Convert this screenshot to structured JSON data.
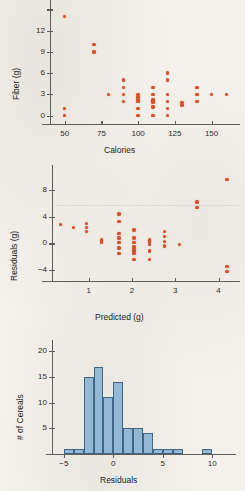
{
  "figure": {
    "background_color": "#f4f1ec",
    "dot_color": "#d9502c",
    "bar_fill_color": "#93b7d4",
    "bar_edge_color": "#3f6687",
    "axis_color": "#5d5d5d"
  },
  "charts": [
    {
      "id": "fiber-vs-calories",
      "type": "scatter",
      "title": "",
      "xlabel": "Calories",
      "ylabel": "Fiber (g)",
      "xticks": [
        50,
        75,
        100,
        125,
        150
      ],
      "xticklabels": [
        "50",
        "75",
        "100",
        "125",
        "150"
      ],
      "yticks": [
        0,
        3,
        6,
        9,
        12,
        15
      ],
      "yticklabels": [
        "0",
        "3",
        "6",
        "9",
        "12",
        ""
      ],
      "xlim": [
        40,
        168
      ],
      "ylim": [
        -1.2,
        15.2
      ],
      "grid": false,
      "points": [
        [
          50,
          14.0
        ],
        [
          50,
          1.0
        ],
        [
          50,
          0.0
        ],
        [
          70,
          10.0
        ],
        [
          70,
          9.0
        ],
        [
          80,
          3.0
        ],
        [
          90,
          5.0
        ],
        [
          90,
          4.0
        ],
        [
          90,
          3.0
        ],
        [
          90,
          2.0
        ],
        [
          100,
          3.0
        ],
        [
          100,
          2.6
        ],
        [
          100,
          2.2
        ],
        [
          100,
          2.0
        ],
        [
          100,
          1.0
        ],
        [
          100,
          0.0
        ],
        [
          110,
          4.0
        ],
        [
          110,
          3.0
        ],
        [
          110,
          2.2
        ],
        [
          110,
          2.0
        ],
        [
          110,
          1.8
        ],
        [
          110,
          1.2
        ],
        [
          110,
          0.0
        ],
        [
          120,
          6.0
        ],
        [
          120,
          5.0
        ],
        [
          120,
          3.0
        ],
        [
          120,
          2.0
        ],
        [
          120,
          1.0
        ],
        [
          120,
          0.0
        ],
        [
          130,
          1.8
        ],
        [
          130,
          1.5
        ],
        [
          140,
          4.0
        ],
        [
          140,
          3.0
        ],
        [
          140,
          2.0
        ],
        [
          150,
          3.0
        ],
        [
          160,
          3.0
        ]
      ]
    },
    {
      "id": "residuals-vs-predicted",
      "type": "scatter",
      "title": "",
      "xlabel": "Predicted (g)",
      "ylabel": "Residuals (g)",
      "xticks": [
        1,
        2,
        3,
        4
      ],
      "xticklabels": [
        "1",
        "2",
        "3",
        "4"
      ],
      "yticks": [
        -4,
        0,
        4,
        8
      ],
      "yticklabels": [
        "−4",
        "0",
        "4",
        "8"
      ],
      "xlim": [
        0.15,
        4.45
      ],
      "ylim": [
        -5.6,
        10.8
      ],
      "grid": false,
      "points": [
        [
          0.35,
          2.8
        ],
        [
          0.65,
          2.4
        ],
        [
          0.95,
          3.0
        ],
        [
          0.95,
          2.4
        ],
        [
          0.95,
          1.8
        ],
        [
          1.3,
          0.5
        ],
        [
          1.3,
          0.2
        ],
        [
          1.7,
          4.4
        ],
        [
          1.7,
          3.3
        ],
        [
          1.7,
          1.5
        ],
        [
          1.7,
          0.8
        ],
        [
          1.7,
          0.1
        ],
        [
          1.7,
          -0.7
        ],
        [
          1.7,
          -1.5
        ],
        [
          2.05,
          2.0
        ],
        [
          2.05,
          0.8
        ],
        [
          2.05,
          0.1
        ],
        [
          2.05,
          -0.5
        ],
        [
          2.05,
          -0.8
        ],
        [
          2.05,
          -1.1
        ],
        [
          2.05,
          -1.5
        ],
        [
          2.05,
          -2.4
        ],
        [
          2.4,
          0.5
        ],
        [
          2.4,
          0.2
        ],
        [
          2.4,
          -0.2
        ],
        [
          2.4,
          -1.1
        ],
        [
          2.4,
          -2.4
        ],
        [
          2.75,
          1.8
        ],
        [
          2.75,
          1.0
        ],
        [
          2.75,
          0.3
        ],
        [
          2.75,
          -0.4
        ],
        [
          3.1,
          -0.2
        ],
        [
          3.5,
          6.2
        ],
        [
          3.5,
          5.4
        ],
        [
          4.2,
          9.5
        ],
        [
          4.2,
          -3.4
        ],
        [
          4.2,
          -4.2
        ]
      ]
    },
    {
      "id": "histogram-of-residuals",
      "type": "bar",
      "title": "",
      "xlabel": "Residuals",
      "ylabel": "# of Cereals",
      "xticks": [
        -5,
        0,
        5,
        10
      ],
      "xticklabels": [
        "−5",
        "0",
        "5",
        "10"
      ],
      "yticks": [
        5,
        10,
        15,
        20
      ],
      "yticklabels": [
        "5",
        "10",
        "15",
        "20"
      ],
      "xlim": [
        -6.2,
        11.8
      ],
      "ylim": [
        0,
        21
      ],
      "bin_width": 1,
      "grid": false,
      "bin_starts": [
        -5,
        -4,
        -3,
        -2,
        -1,
        0,
        1,
        2,
        3,
        4,
        5,
        6,
        9
      ],
      "values": [
        1,
        1,
        15,
        17,
        11,
        14,
        5,
        5,
        4,
        1,
        1,
        1,
        1
      ]
    }
  ]
}
